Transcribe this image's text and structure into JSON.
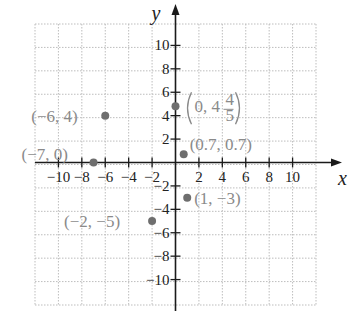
{
  "chart_data": {
    "type": "scatter",
    "title": "",
    "xlabel": "x",
    "ylabel": "y",
    "xlim": [
      -12,
      12
    ],
    "ylim": [
      -12,
      12
    ],
    "grid": true,
    "grid_step": 2,
    "x_ticks": [
      -10,
      -8,
      -6,
      -4,
      -2,
      2,
      4,
      6,
      8,
      10
    ],
    "y_ticks": [
      -10,
      -8,
      -6,
      -4,
      -2,
      2,
      4,
      6,
      8,
      10
    ],
    "x_tick_labels": [
      "−10",
      "−8",
      "−6",
      "−4",
      "−2",
      "2",
      "4",
      "6",
      "8",
      "10"
    ],
    "y_tick_labels": [
      "−10",
      "−8",
      "−6",
      "−4",
      "−2",
      "2",
      "4",
      "6",
      "8",
      "10"
    ],
    "points": [
      {
        "x": -6,
        "y": 4,
        "label": "(−6, 4)"
      },
      {
        "x": -7,
        "y": 0,
        "label": "(−7, 0)"
      },
      {
        "x": 0,
        "y": 4.8,
        "label": "(0, 4 4/5)",
        "label_whole": "(0, 4",
        "label_num": "4",
        "label_den": "5",
        "label_close": ")"
      },
      {
        "x": 0.7,
        "y": 0.7,
        "label": "(0.7, 0.7)"
      },
      {
        "x": 1,
        "y": -3,
        "label": "(1, −3)"
      },
      {
        "x": -2,
        "y": -5,
        "label": "(−2, −5)"
      }
    ],
    "colors": {
      "point": "#6e6e6e",
      "point_label": "#8a8a8a",
      "axis": "#1a1a1a",
      "grid": "#bdbdbd"
    }
  }
}
